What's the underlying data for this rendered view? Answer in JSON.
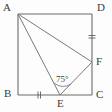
{
  "figure": {
    "kind": "plane-geometry-diagram",
    "canvas": {
      "width": 112,
      "height": 112,
      "background": "#fdfdfd"
    },
    "stroke_color": "#6b6b6b",
    "label_color": "#3b3b3b",
    "vertices": [
      {
        "name": "A",
        "label": "A",
        "x": 18,
        "y": 14,
        "label_x": 3,
        "label_y": 2,
        "role": "square-corner-top-left"
      },
      {
        "name": "D",
        "label": "D",
        "x": 92,
        "y": 14,
        "label_x": 97,
        "label_y": 2,
        "role": "square-corner-top-right"
      },
      {
        "name": "B",
        "label": "B",
        "x": 18,
        "y": 95,
        "label_x": 4,
        "label_y": 88,
        "role": "square-corner-bottom-left"
      },
      {
        "name": "C",
        "label": "C",
        "x": 92,
        "y": 95,
        "label_x": 96,
        "label_y": 89,
        "role": "square-corner-bottom-right"
      },
      {
        "name": "E",
        "label": "E",
        "x": 60,
        "y": 95,
        "label_x": 57,
        "label_y": 98,
        "role": "point-on-bottom-side"
      },
      {
        "name": "F",
        "label": "F",
        "x": 92,
        "y": 62,
        "label_x": 96,
        "label_y": 56,
        "role": "point-on-right-side"
      }
    ],
    "square_sides": [
      {
        "name": "AD",
        "from": "A",
        "to": "D"
      },
      {
        "name": "DC",
        "from": "D",
        "to": "C"
      },
      {
        "name": "CB",
        "from": "C",
        "to": "B"
      },
      {
        "name": "BA",
        "from": "B",
        "to": "A"
      }
    ],
    "segments": [
      {
        "name": "AE",
        "from": "A",
        "to": "E"
      },
      {
        "name": "AF",
        "from": "A",
        "to": "F"
      },
      {
        "name": "EF",
        "from": "E",
        "to": "F"
      }
    ],
    "tick_marks": [
      {
        "name": "tick-on-BE",
        "segment": "BE",
        "count": 2,
        "x": 39,
        "y": 95,
        "orientation": "vertical"
      },
      {
        "name": "tick-on-DF",
        "segment": "DF",
        "count": 2,
        "x": 92,
        "y": 37,
        "orientation": "horizontal"
      }
    ],
    "angles": [
      {
        "name": "angle-AEF",
        "vertex": "E",
        "value": "75",
        "unit": "°",
        "label": "75°",
        "label_x": 56,
        "label_y": 75
      }
    ]
  }
}
